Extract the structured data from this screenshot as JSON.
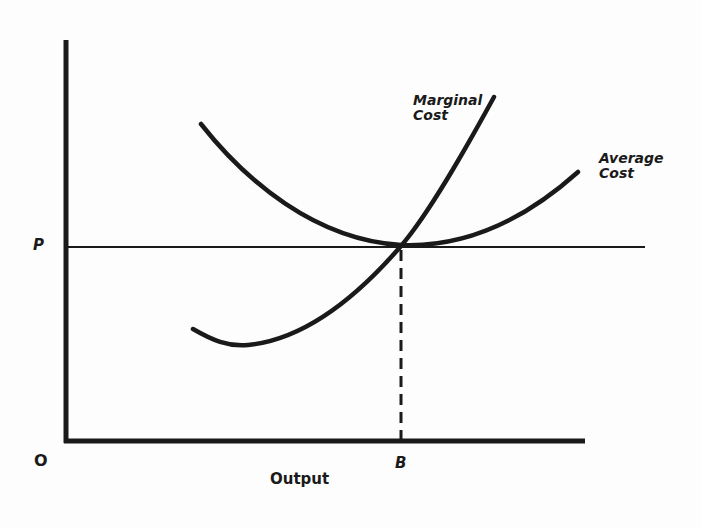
{
  "diagram": {
    "type": "cost-curves",
    "axes": {
      "origin_label": "O",
      "x_axis_label": "Output",
      "y_axis_label": ""
    },
    "price_level": {
      "label": "P"
    },
    "output_mark": {
      "label": "B"
    },
    "curves": [
      {
        "name": "marginal-cost",
        "label": "Marginal\nCost"
      },
      {
        "name": "average-cost",
        "label": "Average\nCost"
      }
    ],
    "colors": {
      "ink": "#1a1a1a",
      "background": "#fdfdfd"
    }
  }
}
